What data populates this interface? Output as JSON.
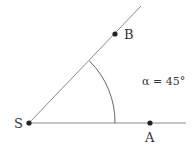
{
  "diagram": {
    "type": "angle",
    "vertex": {
      "label": "S"
    },
    "points": [
      {
        "label": "A",
        "on": "horizontal ray"
      },
      {
        "label": "B",
        "on": "inclined ray"
      }
    ],
    "angle": {
      "symbol": "α",
      "value_deg": 45,
      "text": "α = 45°"
    },
    "colors": {
      "line": "#8a8a8a",
      "point": "#222222",
      "text": "#333333"
    }
  }
}
